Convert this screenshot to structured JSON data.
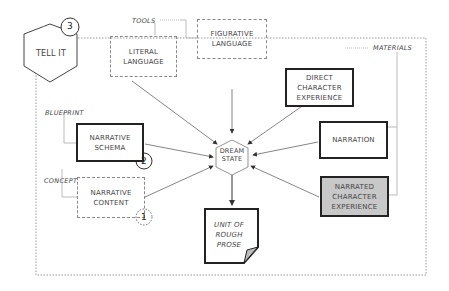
{
  "badge": {
    "label": "TELL IT",
    "number": "3"
  },
  "side_labels": {
    "tools": "TOOLS",
    "materials": "MATERIALS",
    "blueprint": "BLUEPRINT",
    "concept": "CONCEPT"
  },
  "nodes": {
    "literal_language": "LITERAL LANGUAGE",
    "figurative_language": "FIGURATIVE LANGUAGE",
    "direct_character_experience": "DIRECT CHARACTER EXPERIENCE",
    "narration": "NARRATION",
    "narrated_character_experience": "NARRATED CHARACTER EXPERIENCE",
    "narrative_schema": "NARRATIVE SCHEMA",
    "narrative_content": "NARRATIVE CONTENT",
    "dream_state": "DREAM STATE",
    "unit_of_rough_prose": "UNIT OF ROUGH PROSE"
  },
  "step_numbers": {
    "schema": "2",
    "content": "1"
  }
}
